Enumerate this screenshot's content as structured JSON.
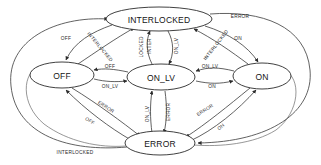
{
  "diagram": {
    "type": "state-machine",
    "background_color": "#ffffff",
    "node_stroke_color": "#2b2b2b",
    "edge_stroke_color": "#3a3a3a",
    "text_color": "#141414",
    "nodes": [
      {
        "id": "interlocked",
        "label": "INTERLOCKED",
        "cx": 159,
        "cy": 19,
        "rx": 53,
        "ry": 12
      },
      {
        "id": "off",
        "label": "OFF",
        "cx": 62,
        "cy": 75,
        "rx": 32,
        "ry": 13
      },
      {
        "id": "on_lv",
        "label": "ON_LV",
        "cx": 161,
        "cy": 77,
        "rx": 34,
        "ry": 13
      },
      {
        "id": "on",
        "label": "ON",
        "cx": 262,
        "cy": 76,
        "rx": 29,
        "ry": 13
      },
      {
        "id": "error",
        "label": "ERROR",
        "cx": 160,
        "cy": 143,
        "rx": 35,
        "ry": 12
      }
    ],
    "edge_labels": [
      {
        "id": "lbl-error-top-right",
        "text": "ERROR",
        "x": 240,
        "y": 16,
        "rotate": 0
      },
      {
        "id": "lbl-on-top-right",
        "text": "ON",
        "x": 238,
        "y": 38,
        "rotate": 0
      },
      {
        "id": "lbl-off-top-left",
        "text": "OFF",
        "x": 66,
        "y": 38,
        "rotate": 0
      },
      {
        "id": "lbl-interlocked-upleft",
        "text": "INTERLOCKED",
        "x": 100,
        "y": 47,
        "rotate": 50
      },
      {
        "id": "lbl-interlocked-upright",
        "text": "INTERLOCKED",
        "x": 216,
        "y": 45,
        "rotate": -52
      },
      {
        "id": "lbl-inter-vert",
        "text": "INTER",
        "x": 149,
        "y": 46,
        "rotate": -90
      },
      {
        "id": "lbl-locked-vert",
        "text": "LOCKED",
        "x": 141,
        "y": 47,
        "rotate": -90
      },
      {
        "id": "lbl-onlv-vert-top",
        "text": "ON_LV",
        "x": 176,
        "y": 46,
        "rotate": -90
      },
      {
        "id": "lbl-off-mid",
        "text": "OFF",
        "x": 110,
        "y": 66,
        "rotate": 0
      },
      {
        "id": "lbl-onlv-mid-left",
        "text": "ON_LV",
        "x": 110,
        "y": 86,
        "rotate": 0
      },
      {
        "id": "lbl-onlv-mid-right",
        "text": "ON_LV",
        "x": 210,
        "y": 66,
        "rotate": 0
      },
      {
        "id": "lbl-on-mid-right",
        "text": "ON",
        "x": 212,
        "y": 86,
        "rotate": 0
      },
      {
        "id": "lbl-error-lowleft",
        "text": "ERROR",
        "x": 106,
        "y": 107,
        "rotate": 33
      },
      {
        "id": "lbl-off-lowleft",
        "text": "OFF",
        "x": 90,
        "y": 121,
        "rotate": 33
      },
      {
        "id": "lbl-onlv-vert-bottom",
        "text": "ON_LV",
        "x": 147,
        "y": 114,
        "rotate": -90
      },
      {
        "id": "lbl-error-vert-bottom",
        "text": "ERROR",
        "x": 168,
        "y": 112,
        "rotate": -90
      },
      {
        "id": "lbl-error-lowright",
        "text": "ERROR",
        "x": 205,
        "y": 110,
        "rotate": -32
      },
      {
        "id": "lbl-on-lowright",
        "text": "ON",
        "x": 221,
        "y": 127,
        "rotate": -40
      },
      {
        "id": "lbl-interlocked-bottom",
        "text": "INTERLOCKED",
        "x": 75,
        "y": 152,
        "rotate": 0
      }
    ],
    "transitions": [
      {
        "from": "off",
        "to": "interlocked",
        "event": "INTERLOCKED"
      },
      {
        "from": "interlocked",
        "to": "off",
        "event": "OFF"
      },
      {
        "from": "on_lv",
        "to": "interlocked",
        "event": "INTERLOCKED"
      },
      {
        "from": "interlocked",
        "to": "on_lv",
        "event": "ON_LV"
      },
      {
        "from": "on",
        "to": "interlocked",
        "event": "INTERLOCKED"
      },
      {
        "from": "interlocked",
        "to": "on",
        "event": "ON"
      },
      {
        "from": "interlocked",
        "to": "error",
        "event": "ERROR"
      },
      {
        "from": "error",
        "to": "interlocked",
        "event": "INTERLOCKED"
      },
      {
        "from": "on_lv",
        "to": "off",
        "event": "OFF"
      },
      {
        "from": "off",
        "to": "on_lv",
        "event": "ON_LV"
      },
      {
        "from": "on",
        "to": "on_lv",
        "event": "ON_LV"
      },
      {
        "from": "on_lv",
        "to": "on",
        "event": "ON"
      },
      {
        "from": "off",
        "to": "error",
        "event": "ERROR"
      },
      {
        "from": "error",
        "to": "off",
        "event": "OFF"
      },
      {
        "from": "on_lv",
        "to": "error",
        "event": "ERROR"
      },
      {
        "from": "error",
        "to": "on_lv",
        "event": "ON_LV"
      },
      {
        "from": "on",
        "to": "error",
        "event": "ERROR"
      },
      {
        "from": "error",
        "to": "on",
        "event": "ON"
      }
    ]
  }
}
